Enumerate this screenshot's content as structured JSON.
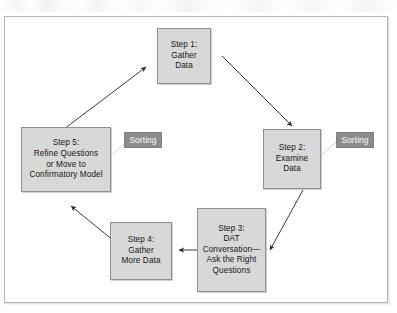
{
  "figure": {
    "type": "cycle-flow-diagram",
    "background_color": "#ffffff",
    "frame_border_color": "#b6b6b6",
    "node_fill_color": "#d8d8d8",
    "node_border_color": "#8f8f8f",
    "badge_fill_color": "#8c8c8c",
    "badge_text_color": "#f0f0f0",
    "arrow_color": "#2b2b2b"
  },
  "nodes": [
    {
      "id": "step-1",
      "label": "Step 1:\nGather\nData"
    },
    {
      "id": "step-2",
      "label": "Step 2:\nExamine\nData"
    },
    {
      "id": "step-3",
      "label": "Step 3:\nDAT\nConversation—\nAsk the Right\nQuestions"
    },
    {
      "id": "step-4",
      "label": "Step 4:\nGather\nMore Data"
    },
    {
      "id": "step-5",
      "label": "Step 5:\nRefine Questions\nor Move to\nConfirmatory Model"
    }
  ],
  "badges": [
    {
      "id": "sorting-left",
      "label": "Sorting",
      "attached_to": "step-5"
    },
    {
      "id": "sorting-right",
      "label": "Sorting",
      "attached_to": "step-2"
    }
  ],
  "arrows": [
    {
      "id": "arrow-5-to-1",
      "from": "step-5",
      "to": "step-1"
    },
    {
      "id": "arrow-1-to-2",
      "from": "step-1",
      "to": "step-2"
    },
    {
      "id": "arrow-2-to-3",
      "from": "step-2",
      "to": "step-3"
    },
    {
      "id": "arrow-3-to-4",
      "from": "step-3",
      "to": "step-4"
    },
    {
      "id": "arrow-4-to-5",
      "from": "step-4",
      "to": "step-5"
    }
  ]
}
